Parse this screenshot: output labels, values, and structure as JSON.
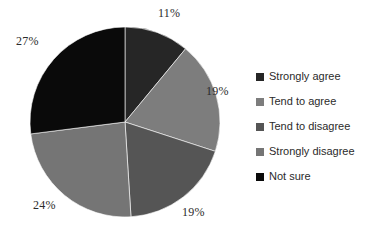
{
  "chart_data": {
    "type": "pie",
    "title": "",
    "categories": [
      "Strongly agree",
      "Tend to agree",
      "Tend to disagree",
      "Strongly disagree",
      "Not sure"
    ],
    "values": [
      11,
      19,
      19,
      24,
      27
    ],
    "value_labels": [
      "11%",
      "19%",
      "19%",
      "24%",
      "27%"
    ],
    "colors": [
      "#262626",
      "#7d7d7d",
      "#555555",
      "#757575",
      "#0a0a0a"
    ],
    "units": "percent",
    "start_angle_deg": 0,
    "direction": "clockwise",
    "legend_position": "right",
    "grid": false,
    "xlabel": "",
    "ylabel": ""
  },
  "labels": {
    "slice_0": "11%",
    "slice_1": "19%",
    "slice_2": "19%",
    "slice_3": "24%",
    "slice_4": "27%"
  },
  "legend": {
    "items": [
      {
        "label": "Strongly agree",
        "color": "#262626"
      },
      {
        "label": "Tend to agree",
        "color": "#7d7d7d"
      },
      {
        "label": "Tend to disagree",
        "color": "#555555"
      },
      {
        "label": "Strongly disagree",
        "color": "#757575"
      },
      {
        "label": "Not sure",
        "color": "#0a0a0a"
      }
    ]
  }
}
